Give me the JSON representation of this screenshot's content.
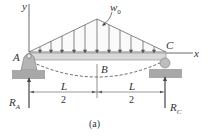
{
  "diagram": {
    "labels": {
      "y_axis": "y",
      "x_axis": "x",
      "load": "w",
      "load_sub": "0",
      "point_a": "A",
      "point_b": "B",
      "point_c": "C",
      "reaction_a": "R",
      "reaction_a_sub": "A",
      "reaction_c": "R",
      "reaction_c_sub": "C",
      "dim_left_num": "L",
      "dim_left_den": "2",
      "dim_right_num": "L",
      "dim_right_den": "2",
      "caption": "(a)"
    },
    "colors": {
      "beam": "#d9d9d9",
      "support": "#b0b0b0",
      "ground": "#9a9a9a",
      "line": "#444444"
    }
  }
}
